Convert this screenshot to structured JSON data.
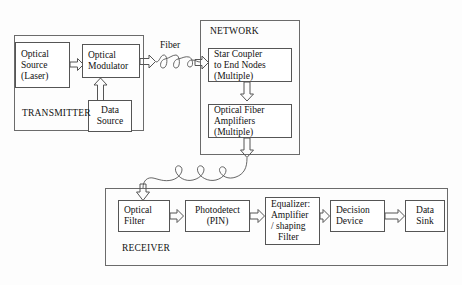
{
  "diagram": {
    "background_color": "#fdfdfd",
    "line_color": "#555555",
    "text_color": "#111111"
  },
  "groups": {
    "transmitter": {
      "label": "TRANSMITTER"
    },
    "network": {
      "label": "NETWORK"
    },
    "receiver": {
      "label": "RECEIVER"
    }
  },
  "edge_labels": {
    "fiber": "Fiber"
  },
  "nodes": {
    "optical_source": {
      "line1": "Optical",
      "line2": "Source",
      "line3": "(Laser)"
    },
    "optical_modulator": {
      "line1": "Optical",
      "line2": "Modulator"
    },
    "data_source": {
      "line1": "Data",
      "line2": "Source"
    },
    "star_coupler": {
      "line1": "Star Coupler",
      "line2": "to End Nodes",
      "line3": "(Multiple)"
    },
    "fiber_amplifiers": {
      "line1": "Optical Fiber",
      "line2": "Amplifiers",
      "line3": "(Multiple)"
    },
    "optical_filter": {
      "line1": "Optical",
      "line2": "Filter"
    },
    "photodetector": {
      "line1": "Photodetect",
      "line2": "(PIN)"
    },
    "equalizer": {
      "line1": "Equalizer:",
      "line2": "Amplifier",
      "line3": "/ shaping",
      "line4": "Filter"
    },
    "decision_device": {
      "line1": "Decision",
      "line2": "Device"
    },
    "data_sink": {
      "line1": "Data",
      "line2": "Sink"
    }
  },
  "connectors": {
    "source_to_modulator": "block-arrow-right",
    "datasource_to_modulator": "block-arrow-up",
    "modulator_to_network": "block-arrow-right",
    "coupler_to_amplifiers": "block-arrow-down",
    "amplifiers_out": "block-arrow-down",
    "fiber_to_filter": "block-arrow-down",
    "filter_to_photodetector": "block-arrow-right",
    "photodetector_to_equalizer": "block-arrow-right",
    "equalizer_to_decision": "block-arrow-right",
    "decision_to_sink": "block-arrow-right",
    "upper_fiber_coil": "coiled-fiber",
    "lower_fiber_coil": "coiled-fiber"
  }
}
